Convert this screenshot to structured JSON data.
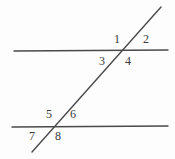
{
  "figure": {
    "name": "parallel-lines-transversal-angles",
    "background_color": "#fdfdfd",
    "line_color": "#4a4a4a",
    "label_color": "#3a3a3a"
  },
  "lines": {
    "top_parallel": {
      "name": "top-parallel-line",
      "x1": 14,
      "y1": 51,
      "x2": 168,
      "y2": 50,
      "stroke_width": 1.4
    },
    "bottom_parallel": {
      "name": "bottom-parallel-line",
      "x1": 12,
      "y1": 127,
      "x2": 168,
      "y2": 126,
      "stroke_width": 1.4
    },
    "transversal": {
      "name": "transversal-line",
      "x1": 32,
      "y1": 152,
      "x2": 161,
      "y2": 7,
      "stroke_width": 1.4
    }
  },
  "intersections": {
    "top": {
      "x": 120,
      "y": 51
    },
    "bottom": {
      "x": 55,
      "y": 126
    }
  },
  "labels": [
    {
      "id": "angle-1",
      "text": "1",
      "x": 114,
      "y": 33
    },
    {
      "id": "angle-2",
      "text": "2",
      "x": 143,
      "y": 33
    },
    {
      "id": "angle-3",
      "text": "3",
      "x": 99,
      "y": 55
    },
    {
      "id": "angle-4",
      "text": "4",
      "x": 125,
      "y": 55
    },
    {
      "id": "angle-5",
      "text": "5",
      "x": 46,
      "y": 108
    },
    {
      "id": "angle-6",
      "text": "6",
      "x": 70,
      "y": 108
    },
    {
      "id": "angle-7",
      "text": "7",
      "x": 29,
      "y": 130
    },
    {
      "id": "angle-8",
      "text": "8",
      "x": 55,
      "y": 130
    }
  ],
  "chart_data": {
    "type": "diagram",
    "title": "",
    "elements": {
      "parallel_lines": 2,
      "transversal_lines": 1,
      "labeled_angles": 8
    },
    "angle_positions": {
      "top_intersection": [
        "1",
        "2",
        "3",
        "4"
      ],
      "bottom_intersection": [
        "5",
        "6",
        "7",
        "8"
      ]
    }
  }
}
